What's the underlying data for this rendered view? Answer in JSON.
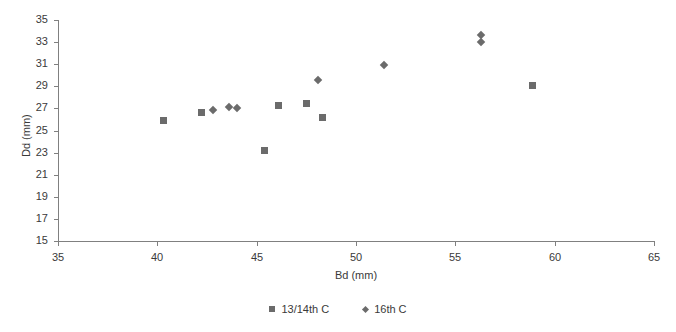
{
  "chart_data": {
    "type": "scatter",
    "title": "",
    "xlabel": "Bd (mm)",
    "ylabel": "Dd (mm)",
    "xlim": [
      35,
      65
    ],
    "ylim": [
      15,
      35
    ],
    "xticks": [
      35,
      40,
      45,
      50,
      55,
      60,
      65
    ],
    "yticks": [
      15,
      17,
      19,
      21,
      23,
      25,
      27,
      29,
      31,
      33,
      35
    ],
    "grid": false,
    "legend_position": "bottom-center",
    "marker_color": "#6b6b6b",
    "axis_color": "#808080",
    "series": [
      {
        "name": "13/14th C",
        "marker": "square",
        "points": [
          {
            "x": 40.3,
            "y": 25.9
          },
          {
            "x": 42.2,
            "y": 26.6
          },
          {
            "x": 45.4,
            "y": 23.2
          },
          {
            "x": 46.1,
            "y": 27.3
          },
          {
            "x": 47.5,
            "y": 27.4
          },
          {
            "x": 48.3,
            "y": 26.2
          },
          {
            "x": 58.9,
            "y": 29.1
          }
        ]
      },
      {
        "name": "16th C",
        "marker": "diamond",
        "points": [
          {
            "x": 42.8,
            "y": 26.9
          },
          {
            "x": 43.6,
            "y": 27.1
          },
          {
            "x": 44.0,
            "y": 27.0
          },
          {
            "x": 48.1,
            "y": 29.6
          },
          {
            "x": 51.4,
            "y": 30.9
          },
          {
            "x": 56.3,
            "y": 33.6
          },
          {
            "x": 56.3,
            "y": 33.0
          }
        ]
      }
    ]
  },
  "legend": {
    "items": [
      {
        "label": "13/14th C",
        "marker": "square"
      },
      {
        "label": "16th C",
        "marker": "diamond"
      }
    ]
  }
}
